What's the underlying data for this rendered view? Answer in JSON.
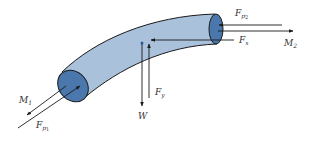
{
  "diagram": {
    "type": "free-body diagram of curved pipe segment",
    "colors": {
      "pipe_body": "#a9c1da",
      "pipe_end": "#4a78ad",
      "outline": "#1a1a1a",
      "arrow": "#1a1a1a",
      "background": "#ffffff"
    },
    "labels": {
      "M1": {
        "base": "M",
        "sub": "1"
      },
      "Fp1": {
        "base": "F",
        "sub": "p",
        "subsub": "1"
      },
      "Fp2": {
        "base": "F",
        "sub": "p",
        "subsub": "2"
      },
      "M2": {
        "base": "M",
        "sub": "2"
      },
      "Fx": {
        "base": "F",
        "sub": "x"
      },
      "Fy": {
        "base": "F",
        "sub": "y"
      },
      "W": {
        "base": "W"
      }
    }
  }
}
